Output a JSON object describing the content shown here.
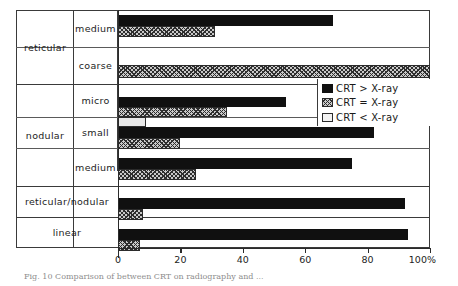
{
  "figure": {
    "caption": "Fig. 10  Comparison of between CRT on radiography and ..."
  },
  "axis": {
    "ticks": [
      "0",
      "20",
      "40",
      "60",
      "80",
      "100%"
    ],
    "tick_values": [
      0,
      20,
      40,
      60,
      80,
      100
    ],
    "min": 0,
    "max": 100,
    "unit": "%"
  },
  "legend": {
    "items": [
      {
        "label": "CRT > X-ray",
        "key": "gt",
        "swatch": "solid-black-swatch"
      },
      {
        "label": "CRT = X-ray",
        "key": "eq",
        "swatch": "hatched-grey-swatch"
      },
      {
        "label": "CRT < X-ray",
        "key": "lt",
        "swatch": "light-open-swatch"
      }
    ]
  },
  "groups": [
    {
      "label": "reticular",
      "rows": [
        0,
        1
      ]
    },
    {
      "label": "nodular",
      "rows": [
        2,
        3,
        4
      ]
    }
  ],
  "rows": [
    {
      "group": "reticular",
      "sub": "medium"
    },
    {
      "group": "reticular",
      "sub": "coarse"
    },
    {
      "group": "nodular",
      "sub": "micro"
    },
    {
      "group": "nodular",
      "sub": "small"
    },
    {
      "group": "nodular",
      "sub": "medium"
    },
    {
      "group": "reticular/nodular",
      "sub": ""
    },
    {
      "group": "linear",
      "sub": ""
    }
  ],
  "chart_data": {
    "type": "bar",
    "orientation": "horizontal",
    "title": "",
    "xlabel": "100%",
    "ylabel": "",
    "xlim": [
      0,
      100
    ],
    "grid": false,
    "legend_position": "inside-right",
    "categories": [
      "reticular / medium",
      "reticular / coarse",
      "nodular / micro",
      "nodular / small",
      "nodular / medium",
      "reticular/nodular",
      "linear"
    ],
    "series": [
      {
        "name": "CRT > X-ray",
        "key": "gt",
        "values": [
          69,
          0,
          54,
          82,
          75,
          92,
          93
        ]
      },
      {
        "name": "CRT = X-ray",
        "key": "eq",
        "values": [
          31,
          100,
          35,
          20,
          25,
          8,
          7
        ]
      },
      {
        "name": "CRT < X-ray",
        "key": "lt",
        "values": [
          0,
          0,
          9,
          0,
          0,
          0,
          0
        ]
      }
    ]
  }
}
